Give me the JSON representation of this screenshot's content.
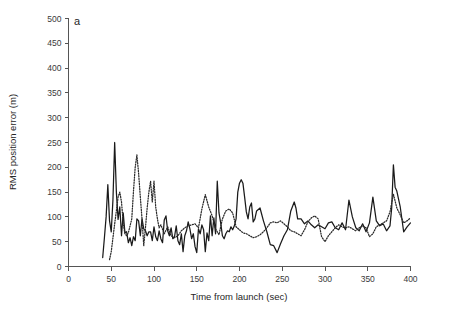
{
  "chart_data": {
    "type": "line",
    "title": "",
    "panel_label": "a",
    "xlabel": "Time from launch (sec)",
    "ylabel": "RMS position error (m)",
    "xlim": [
      0,
      400
    ],
    "ylim": [
      0,
      500
    ],
    "xticks": [
      0,
      50,
      100,
      150,
      200,
      250,
      300,
      350,
      400
    ],
    "yticks": [
      0,
      50,
      100,
      150,
      200,
      250,
      300,
      350,
      400,
      450,
      500
    ],
    "xtick_labels": [
      "0",
      "50",
      "100",
      "150",
      "200",
      "250",
      "300",
      "350",
      "400"
    ],
    "ytick_labels": [
      "0",
      "50",
      "100",
      "150",
      "200",
      "250",
      "300",
      "350",
      "400",
      "450",
      "500"
    ],
    "grid": false,
    "legend": "none",
    "series": [
      {
        "name": "solid-line",
        "style": "solid",
        "color": "#1a1a1a",
        "x": [
          40,
          42,
          44,
          46,
          48,
          50,
          52,
          54,
          56,
          58,
          60,
          62,
          64,
          66,
          68,
          70,
          72,
          74,
          76,
          78,
          80,
          82,
          84,
          86,
          88,
          90,
          92,
          94,
          96,
          98,
          100,
          102,
          104,
          106,
          108,
          110,
          112,
          114,
          116,
          118,
          120,
          122,
          124,
          126,
          128,
          130,
          132,
          134,
          136,
          138,
          140,
          142,
          144,
          146,
          148,
          150,
          152,
          154,
          156,
          158,
          160,
          162,
          164,
          166,
          168,
          170,
          172,
          174,
          176,
          178,
          180,
          182,
          184,
          186,
          188,
          190,
          192,
          194,
          196,
          198,
          200,
          202,
          204,
          206,
          208,
          210,
          212,
          214,
          216,
          218,
          220,
          224,
          228,
          232,
          236,
          240,
          244,
          248,
          252,
          256,
          260,
          264,
          266,
          268,
          272,
          276,
          280,
          284,
          288,
          292,
          296,
          300,
          304,
          308,
          312,
          316,
          320,
          324,
          328,
          332,
          336,
          340,
          344,
          348,
          352,
          356,
          360,
          364,
          368,
          372,
          376,
          378,
          380,
          382,
          384,
          388,
          392,
          396,
          400
        ],
        "y": [
          18,
          58,
          100,
          165,
          92,
          70,
          135,
          250,
          150,
          95,
          120,
          62,
          108,
          68,
          70,
          48,
          58,
          42,
          60,
          52,
          96,
          92,
          62,
          96,
          76,
          72,
          62,
          70,
          70,
          52,
          80,
          60,
          52,
          72,
          56,
          48,
          94,
          102,
          72,
          62,
          78,
          56,
          60,
          82,
          52,
          44,
          66,
          30,
          62,
          72,
          90,
          76,
          56,
          66,
          40,
          28,
          76,
          66,
          84,
          74,
          30,
          68,
          52,
          102,
          62,
          98,
          66,
          172,
          108,
          88,
          62,
          56,
          66,
          72,
          70,
          80,
          74,
          82,
          96,
          150,
          168,
          175,
          168,
          140,
          110,
          96,
          120,
          128,
          90,
          96,
          112,
          118,
          92,
          70,
          44,
          42,
          28,
          46,
          62,
          74,
          112,
          130,
          118,
          96,
          96,
          86,
          92,
          84,
          78,
          84,
          80,
          76,
          88,
          90,
          78,
          74,
          88,
          74,
          134,
          100,
          78,
          72,
          86,
          70,
          88,
          140,
          92,
          82,
          86,
          72,
          82,
          118,
          205,
          160,
          152,
          120,
          70,
          80,
          88
        ]
      },
      {
        "name": "dotted-line",
        "style": "dotted",
        "color": "#2a2a2a",
        "x": [
          48,
          50,
          52,
          54,
          56,
          58,
          60,
          62,
          64,
          66,
          68,
          70,
          72,
          74,
          76,
          78,
          80,
          82,
          84,
          86,
          88,
          90,
          92,
          94,
          96,
          98,
          100,
          102,
          104,
          106,
          108,
          112,
          116,
          120,
          124,
          128,
          132,
          136,
          140,
          144,
          148,
          152,
          156,
          160,
          164,
          168,
          172,
          176,
          180,
          184,
          188,
          192,
          196,
          200,
          204,
          208,
          212,
          216,
          220,
          224,
          228,
          232,
          236,
          240,
          244,
          248,
          252,
          256,
          260,
          264,
          268,
          272,
          276,
          280,
          284,
          288,
          292,
          296,
          300,
          304,
          308,
          312,
          316,
          320,
          324,
          328,
          332,
          336,
          340,
          344,
          348,
          352,
          356,
          360,
          364,
          368,
          372,
          376,
          380,
          384,
          388,
          392,
          396,
          400
        ],
        "y": [
          14,
          30,
          58,
          86,
          112,
          140,
          150,
          130,
          88,
          66,
          62,
          68,
          82,
          96,
          152,
          200,
          225,
          188,
          140,
          96,
          42,
          78,
          118,
          150,
          172,
          130,
          172,
          120,
          96,
          78,
          84,
          66,
          80,
          62,
          58,
          62,
          72,
          78,
          82,
          84,
          86,
          78,
          116,
          145,
          120,
          102,
          76,
          64,
          96,
          112,
          116,
          108,
          80,
          74,
          68,
          66,
          62,
          58,
          60,
          64,
          70,
          78,
          88,
          90,
          88,
          92,
          86,
          80,
          72,
          70,
          66,
          62,
          74,
          90,
          98,
          102,
          96,
          60,
          50,
          62,
          70,
          78,
          84,
          80,
          78,
          80,
          76,
          72,
          78,
          82,
          78,
          60,
          66,
          80,
          84,
          88,
          92,
          110,
          146,
          118,
          104,
          88,
          92,
          98
        ]
      }
    ]
  },
  "axes": {
    "panel_label": "a"
  }
}
